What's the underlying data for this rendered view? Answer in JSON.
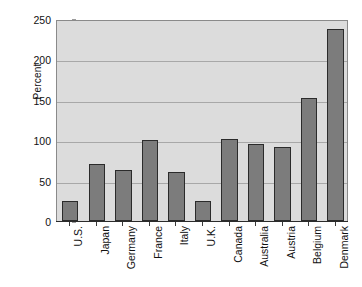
{
  "chart_data": {
    "type": "bar",
    "title": "",
    "xlabel": "",
    "ylabel": "Percent",
    "categories": [
      "U.S.",
      "Japan",
      "Germany",
      "France",
      "Italy",
      "U.K.",
      "Canada",
      "Australia",
      "Austria",
      "Belgium",
      "Denmark"
    ],
    "values": [
      25,
      70,
      63,
      100,
      61,
      25,
      101,
      95,
      92,
      152,
      238
    ],
    "ylim": [
      0,
      250
    ],
    "ytick_labels": [
      "0",
      "50",
      "100",
      "150",
      "200",
      "250"
    ],
    "ytick_values": [
      0,
      50,
      100,
      150,
      200,
      250
    ],
    "grid": "horizontal",
    "legend": "none",
    "plot_background": "#dcdcdc",
    "bar_color": "#7c7c7c",
    "bar_edge_color": "#2b2b2b",
    "figure_background": "#ffffff"
  }
}
